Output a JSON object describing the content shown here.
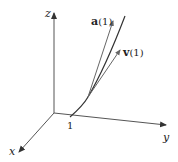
{
  "diagram": {
    "type": "3d-space-curve-with-vectors",
    "axes": {
      "x": {
        "label": "x"
      },
      "y": {
        "label": "y"
      },
      "z": {
        "label": "z"
      }
    },
    "tick": {
      "label": "1"
    },
    "vectors": [
      {
        "id": "a",
        "label_bold": "a",
        "label_rest": "(1)"
      },
      {
        "id": "v",
        "label_bold": "v",
        "label_rest": "(1)"
      }
    ],
    "colors": {
      "axis": "#444444",
      "curve": "#333333",
      "vector": "#555555",
      "background": "#ffffff"
    }
  }
}
